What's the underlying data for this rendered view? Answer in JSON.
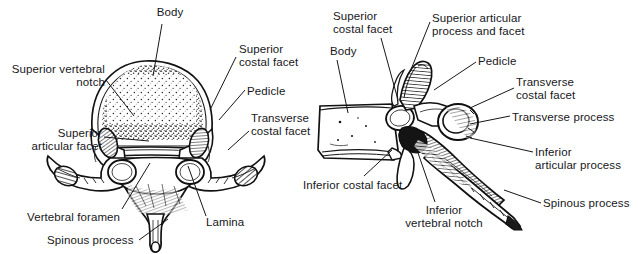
{
  "figure": {
    "background_color": "#ffffff",
    "ink_color": "#17171b",
    "panels": [
      {
        "name": "superior-view",
        "caption": ""
      },
      {
        "name": "lateral-view",
        "caption": ""
      }
    ]
  },
  "labels": {
    "left_panel": [
      {
        "id": "body",
        "text": "Body",
        "align": "center",
        "x": 150,
        "y": 6,
        "w": 40
      },
      {
        "id": "superior_vertebral_notch",
        "text": "Superior vertebral\nnotch",
        "align": "right",
        "x": 2,
        "y": 63,
        "w": 103
      },
      {
        "id": "superior_costal_facet",
        "text": "Superior\ncostal facet",
        "align": "left",
        "x": 239,
        "y": 43,
        "w": 85
      },
      {
        "id": "pedicle",
        "text": "Pedicle",
        "align": "left",
        "x": 247,
        "y": 85,
        "w": 60
      },
      {
        "id": "transverse_costal_facet",
        "text": "Transverse\ncostal facet",
        "align": "left",
        "x": 251,
        "y": 112,
        "w": 85
      },
      {
        "id": "superior_articular_facet",
        "text": "Superior\narticular facet",
        "align": "right",
        "x": 8,
        "y": 127,
        "w": 94
      },
      {
        "id": "vertebral_foramen",
        "text": "Vertebral foramen",
        "align": "left",
        "x": 27,
        "y": 211,
        "w": 110
      },
      {
        "id": "spinous_process_sup",
        "text": "Spinous process",
        "align": "left",
        "x": 47,
        "y": 234,
        "w": 100
      },
      {
        "id": "lamina",
        "text": "Lamina",
        "align": "left",
        "x": 206,
        "y": 216,
        "w": 55
      }
    ],
    "right_panel": [
      {
        "id": "superior_costal_facet_lat",
        "text": "Superior\ncostal facet",
        "align": "left",
        "x": 333,
        "y": 10,
        "w": 85
      },
      {
        "id": "body_lat",
        "text": "Body",
        "align": "left",
        "x": 330,
        "y": 45,
        "w": 40
      },
      {
        "id": "superior_articular_process",
        "text": "Superior articular\nprocess and facet",
        "align": "left",
        "x": 432,
        "y": 12,
        "w": 112
      },
      {
        "id": "pedicle_lat",
        "text": "Pedicle",
        "align": "left",
        "x": 478,
        "y": 55,
        "w": 60
      },
      {
        "id": "transverse_costal_facet_lat",
        "text": "Transverse\ncostal facet",
        "align": "left",
        "x": 516,
        "y": 76,
        "w": 85
      },
      {
        "id": "transverse_process",
        "text": "Transverse process",
        "align": "left",
        "x": 512,
        "y": 111,
        "w": 120
      },
      {
        "id": "inferior_articular_process",
        "text": "Inferior\narticular process",
        "align": "left",
        "x": 535,
        "y": 146,
        "w": 98
      },
      {
        "id": "spinous_process_lat",
        "text": "Spinous process",
        "align": "left",
        "x": 543,
        "y": 197,
        "w": 95
      },
      {
        "id": "inferior_costal_facet",
        "text": "Inferior costal facet",
        "align": "left",
        "x": 303,
        "y": 179,
        "w": 118
      },
      {
        "id": "inferior_vertebral_notch",
        "text": "Inferior\nvertebral notch",
        "align": "center",
        "x": 398,
        "y": 204,
        "w": 92
      }
    ]
  },
  "leaders": {
    "left_panel": [
      {
        "id": "leader-body",
        "points": "162,24 153,76"
      },
      {
        "id": "leader-superior-vertebral-notch",
        "points": "106,78 131,114"
      },
      {
        "id": "leader-superior-costal-facet",
        "points": "236,56 216,107"
      },
      {
        "id": "leader-pedicle",
        "points": "244,90 222,118"
      },
      {
        "id": "leader-transverse-costal-facet",
        "points": "248,130 223,144"
      },
      {
        "id": "leader-superior-articular-facet",
        "points": "104,136 146,140"
      },
      {
        "id": "leader-vertebral-foramen",
        "points": "122,209 148,162"
      },
      {
        "id": "leader-spinous-process",
        "points": "137,240 168,215"
      },
      {
        "id": "leader-lamina",
        "points": "207,216 190,163"
      }
    ],
    "right_panel": [
      {
        "id": "leader-superior-costal-facet-lat",
        "points": "381,38 397,93"
      },
      {
        "id": "leader-body-lat",
        "points": "337,60 347,111"
      },
      {
        "id": "leader-superior-articular-process",
        "points": "431,22 410,72"
      },
      {
        "id": "leader-pedicle-lat",
        "points": "476,62 432,88"
      },
      {
        "id": "leader-transverse-costal-facet-lat",
        "points": "513,88 468,105"
      },
      {
        "id": "leader-transverse-process",
        "points": "510,116 470,122"
      },
      {
        "id": "leader-inferior-articular-process",
        "points": "533,152 474,136"
      },
      {
        "id": "leader-spinous-process-lat",
        "points": "541,203 505,188"
      },
      {
        "id": "leader-inferior-costal-facet",
        "points": "365,176 393,148"
      },
      {
        "id": "leader-inferior-vertebral-notch",
        "points": "435,202 419,150"
      }
    ]
  }
}
